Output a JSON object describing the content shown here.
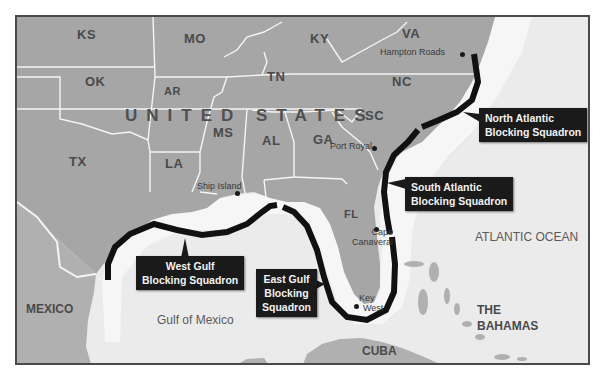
{
  "map": {
    "colors": {
      "land_us": "#a6a6a6",
      "land_other": "#b2b2b2",
      "water": "#ebebeb",
      "coast_shallow": "#f6f6f6",
      "borders": "#f5f5f5",
      "blockade_line": "#111111",
      "callout_bg": "#1a1a1a",
      "callout_text": "#f2f2f2",
      "frame": "#4a4a4a"
    },
    "country_label": "UNITED STATES",
    "states": [
      {
        "code": "KS"
      },
      {
        "code": "MO"
      },
      {
        "code": "KY"
      },
      {
        "code": "VA"
      },
      {
        "code": "OK"
      },
      {
        "code": "AR"
      },
      {
        "code": "TN"
      },
      {
        "code": "NC"
      },
      {
        "code": "SC"
      },
      {
        "code": "MS"
      },
      {
        "code": "AL"
      },
      {
        "code": "GA"
      },
      {
        "code": "TX"
      },
      {
        "code": "LA"
      },
      {
        "code": "FL"
      }
    ],
    "places": [
      {
        "name": "Hampton Roads"
      },
      {
        "name": "Port Royal"
      },
      {
        "name": "Ship Island"
      },
      {
        "name_line1": "Cape",
        "name_line2": "Canaveral"
      },
      {
        "name_line1": "Key",
        "name_line2": "West"
      }
    ],
    "other_countries": [
      "MEXICO",
      "CUBA",
      "THE",
      "BAHAMAS"
    ],
    "water_bodies": [
      "Gulf of Mexico",
      "ATLANTIC OCEAN"
    ],
    "squadrons": [
      {
        "line1": "North Atlantic",
        "line2": "Blocking Squadron"
      },
      {
        "line1": "South Atlantic",
        "line2": "Blocking Squadron"
      },
      {
        "line1": "West Gulf",
        "line2": "Blocking Squadron"
      },
      {
        "line1": "East Gulf",
        "line2": "Blocking",
        "line3": "Squadron"
      }
    ]
  }
}
